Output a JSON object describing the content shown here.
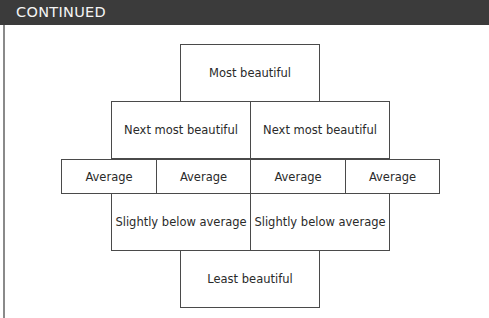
{
  "header": {
    "title": "CONTINUED",
    "background": "#3b3b3b"
  },
  "diagram": {
    "rows": [
      {
        "cells": [
          "Most beautiful"
        ]
      },
      {
        "cells": [
          "Next most beautiful",
          "Next most beautiful"
        ]
      },
      {
        "cells": [
          "Average",
          "Average",
          "Average",
          "Average"
        ]
      },
      {
        "cells": [
          "Slightly below average",
          "Slightly below average"
        ]
      },
      {
        "cells": [
          "Least beautiful"
        ]
      }
    ]
  }
}
